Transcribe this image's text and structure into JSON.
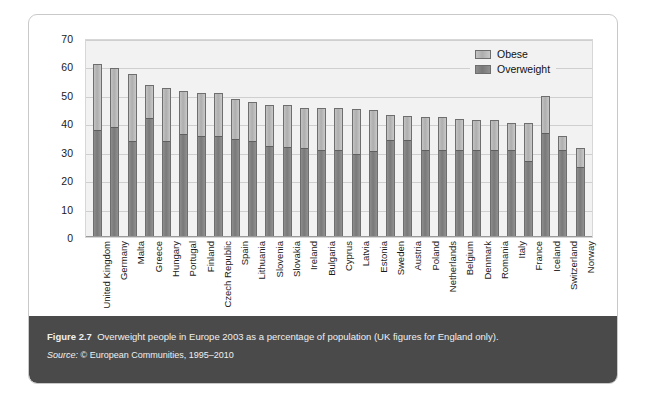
{
  "figure": {
    "caption_label": "Figure 2.7",
    "caption_text": "Overweight people in Europe 2003 as a percentage of population (UK figures for England only).",
    "source_label": "Source:",
    "source_text": "© European Communities, 1995–2010"
  },
  "legend": {
    "position": "top-right",
    "entries": [
      {
        "label": "Obese",
        "color": "#bcbcbc"
      },
      {
        "label": "Overweight",
        "color": "#858585"
      }
    ]
  },
  "chart_data": {
    "type": "bar",
    "stacked": true,
    "title": "",
    "subtitle": "",
    "xlabel": "",
    "ylabel": "",
    "ylim": [
      0,
      70
    ],
    "yticks": [
      0,
      10,
      20,
      30,
      40,
      50,
      60,
      70
    ],
    "grid": true,
    "legend_position": "top-right",
    "categories": [
      "United Kingdom",
      "Germany",
      "Malta",
      "Greece",
      "Hungary",
      "Portugal",
      "Finland",
      "Czech Republic",
      "Spain",
      "Lithuania",
      "Slovenia",
      "Slovakia",
      "Ireland",
      "Bulgaria",
      "Cyprus",
      "Latvia",
      "Estonia",
      "Sweden",
      "Austria",
      "Poland",
      "Netherlands",
      "Belgium",
      "Denmark",
      "Romania",
      "Italy",
      "France",
      "Iceland",
      "Switzerland",
      "Norway"
    ],
    "series": [
      {
        "name": "Overweight",
        "color": "#858585",
        "values": [
          38,
          39,
          34,
          42.5,
          34,
          36.5,
          36,
          36,
          35,
          34,
          32.5,
          32,
          31.5,
          31,
          31,
          29.5,
          30.5,
          34.5,
          34.5,
          31,
          31,
          31,
          31,
          31,
          31,
          27,
          37,
          31,
          25
        ]
      },
      {
        "name": "Obese",
        "color": "#bcbcbc",
        "values": [
          23.5,
          21,
          24,
          11.5,
          19,
          15.5,
          15,
          15,
          14,
          14,
          14.5,
          15,
          14.5,
          15,
          15,
          16,
          14.5,
          9,
          8.5,
          11.5,
          11.5,
          11,
          10.5,
          10.5,
          9.5,
          13.5,
          13,
          5,
          6.5
        ]
      }
    ],
    "totals": [
      61.5,
      60,
      58,
      54,
      53,
      52,
      51,
      51,
      49,
      48,
      47,
      47,
      46,
      46,
      46,
      45.5,
      45,
      43.5,
      43,
      42.5,
      42.5,
      42,
      41.5,
      41.5,
      40.5,
      40.5,
      50,
      36,
      31.5
    ]
  }
}
